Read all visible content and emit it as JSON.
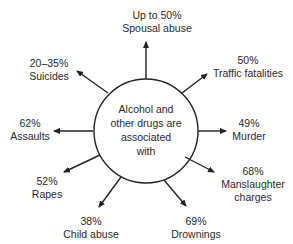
{
  "center": {
    "lines": [
      "Alcohol and",
      "other drugs are",
      "associated",
      "with"
    ]
  },
  "items": [
    {
      "value": "Up to 50%",
      "label": "Spousal abuse"
    },
    {
      "value": "50%",
      "label": "Traffic fatalities"
    },
    {
      "value": "49%",
      "label": "Murder"
    },
    {
      "value": "68%",
      "label": "Manslaughter",
      "label2": "charges"
    },
    {
      "value": "69%",
      "label": "Drownings"
    },
    {
      "value": "38%",
      "label": "Child abuse"
    },
    {
      "value": "52%",
      "label": "Rapes"
    },
    {
      "value": "62%",
      "label": "Assaults"
    },
    {
      "value": "20–35%",
      "label": "Suicides"
    }
  ],
  "colors": {
    "stroke": "#222222",
    "text": "#2a2a2a"
  }
}
